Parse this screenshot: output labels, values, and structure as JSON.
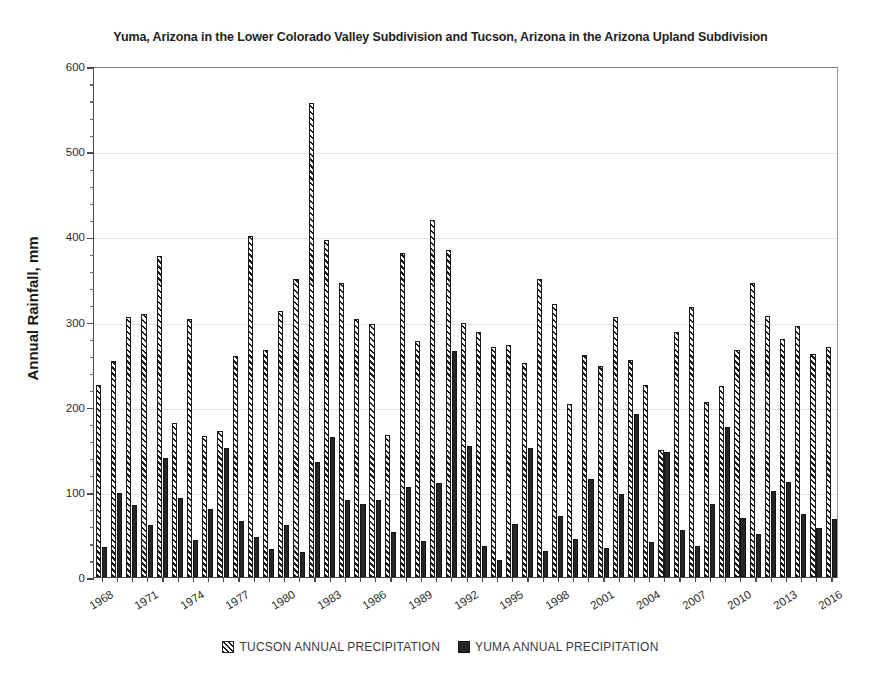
{
  "chart_data": {
    "type": "bar",
    "title": "Yuma, Arizona in the Lower Colorado Valley Subdivision and Tucson, Arizona in the Arizona Upland Subdivision",
    "xlabel": "",
    "ylabel": "Annual Rainfall, mm",
    "ylim": [
      0,
      600
    ],
    "ytick_step": 100,
    "yminor_step": 20,
    "grid": true,
    "legend_position": "bottom",
    "xtick_labels": [
      "1968",
      "1971",
      "1974",
      "1977",
      "1980",
      "1983",
      "1986",
      "1989",
      "1992",
      "1995",
      "1998",
      "2001",
      "2004",
      "2007",
      "2010",
      "2013",
      "2016"
    ],
    "xtick_step": 3,
    "categories": [
      "1968",
      "1969",
      "1970",
      "1971",
      "1972",
      "1973",
      "1974",
      "1975",
      "1976",
      "1977",
      "1978",
      "1979",
      "1980",
      "1981",
      "1982",
      "1983",
      "1984",
      "1985",
      "1986",
      "1987",
      "1988",
      "1989",
      "1990",
      "1991",
      "1992",
      "1993",
      "1994",
      "1995",
      "1996",
      "1997",
      "1998",
      "1999",
      "2000",
      "2001",
      "2002",
      "2003",
      "2004",
      "2005",
      "2006",
      "2007",
      "2008",
      "2009",
      "2010",
      "2011",
      "2012",
      "2013",
      "2014",
      "2015",
      "2016"
    ],
    "series": [
      {
        "name": "TUCSON ANNUAL PRECIPITATION",
        "color": "#1c1c1c",
        "pattern": "diagonal-hatch",
        "values": [
          226,
          254,
          305,
          309,
          377,
          181,
          303,
          166,
          171,
          259,
          400,
          267,
          312,
          350,
          557,
          396,
          345,
          303,
          297,
          167,
          381,
          277,
          419,
          384,
          298,
          288,
          270,
          272,
          251,
          350,
          321,
          203,
          261,
          248,
          305,
          255,
          225,
          149,
          288,
          317,
          206,
          224,
          266,
          345,
          306,
          280,
          295,
          262,
          270
        ]
      },
      {
        "name": "YUMA ANNUAL PRECIPITATION",
        "color": "#262626",
        "pattern": "solid",
        "values": [
          35,
          99,
          84,
          61,
          140,
          93,
          44,
          80,
          152,
          66,
          47,
          33,
          61,
          29,
          135,
          164,
          90,
          86,
          91,
          53,
          106,
          42,
          110,
          265,
          154,
          37,
          20,
          62,
          152,
          30,
          72,
          45,
          115,
          34,
          97,
          191,
          41,
          147,
          55,
          36,
          86,
          176,
          69,
          51,
          101,
          111,
          74,
          57,
          68
        ]
      }
    ]
  },
  "legend": {
    "items": [
      {
        "label": "TUCSON ANNUAL PRECIPITATION"
      },
      {
        "label": "YUMA ANNUAL PRECIPITATION"
      }
    ]
  }
}
